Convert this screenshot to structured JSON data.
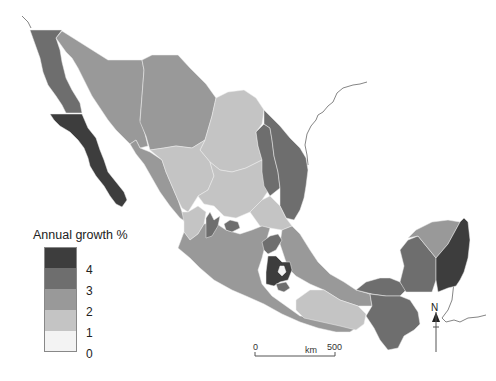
{
  "map": {
    "title": "Annual growth by state, Mexico",
    "legend": {
      "title": "Annual growth %",
      "classes": [
        {
          "label": "4",
          "color": "#3d3d3d"
        },
        {
          "label": "3",
          "color": "#6e6e6e"
        },
        {
          "label": "2",
          "color": "#999999"
        },
        {
          "label": "1",
          "color": "#c4c4c4"
        },
        {
          "label": "0",
          "color": "#f3f3f3"
        }
      ]
    },
    "scale_bar": {
      "start": "0",
      "unit": "km",
      "end": "500"
    },
    "north_arrow": {
      "label": "N"
    }
  }
}
